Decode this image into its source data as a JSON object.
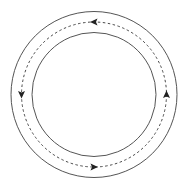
{
  "diagram": {
    "type": "annular-flow",
    "center": [
      94,
      94.5
    ],
    "outer_circle": {
      "radius": 83,
      "stroke": "#555555",
      "stroke_width": 1
    },
    "inner_circle": {
      "radius": 62,
      "stroke": "#555555",
      "stroke_width": 1
    },
    "flow_path": {
      "radius": 72.5,
      "stroke": "#333333",
      "stroke_width": 0.9,
      "dash": "2.5 2.5",
      "direction": "counterclockwise"
    },
    "arrows": [
      {
        "name": "top-arrow",
        "position": "top",
        "angle_deg": 90,
        "points": "left"
      },
      {
        "name": "left-arrow",
        "position": "left",
        "angle_deg": 180,
        "points": "down"
      },
      {
        "name": "bottom-arrow",
        "position": "bottom",
        "angle_deg": 270,
        "points": "right"
      },
      {
        "name": "right-arrow",
        "position": "right",
        "angle_deg": 0,
        "points": "up"
      }
    ],
    "arrow_color": "#222222"
  }
}
